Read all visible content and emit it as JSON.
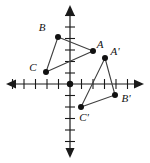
{
  "figure": {
    "width": 150,
    "height": 163,
    "background_color": "#ffffff",
    "axis_color": "#1a1a1a",
    "shape_color": "#3f3f3f",
    "point_color": "#111111"
  },
  "axes": {
    "origin": {
      "x": 70,
      "y": 84
    },
    "tick_spacing": 11.5,
    "x_axis": {
      "start_x": 6,
      "end_x": 144,
      "y": 84,
      "ticks": [
        -5,
        -4,
        -3,
        -2,
        -1,
        1,
        2,
        3,
        4,
        5
      ]
    },
    "y_axis": {
      "x": 70,
      "start_y": 5,
      "end_y": 158,
      "ticks": [
        -6,
        -5,
        -4,
        -3,
        -2,
        -1,
        1,
        2,
        3,
        4,
        5,
        6
      ]
    },
    "arrowheads": [
      "left",
      "right",
      "up",
      "down"
    ],
    "labels_shown": false
  },
  "shapes": [
    {
      "name": "triangle-abc",
      "closed": true,
      "vertices": [
        {
          "label": "B",
          "px": {
            "x": 58,
            "y": 37
          },
          "grid": {
            "x": -1,
            "y": 4
          },
          "label_px": {
            "x": 42,
            "y": 31
          }
        },
        {
          "label": "A",
          "px": {
            "x": 93,
            "y": 51
          },
          "grid": {
            "x": 2,
            "y": 3
          },
          "label_px": {
            "x": 96,
            "y": 48
          }
        },
        {
          "label": "C",
          "px": {
            "x": 46,
            "y": 72
          },
          "grid": {
            "x": -2,
            "y": 1
          },
          "label_px": {
            "x": 29,
            "y": 71
          }
        }
      ]
    },
    {
      "name": "triangle-a-prime-b-prime-c-prime",
      "closed": true,
      "vertices": [
        {
          "label": "A'",
          "px": {
            "x": 105,
            "y": 58
          },
          "grid": {
            "x": 3,
            "y": 2
          },
          "label_px": {
            "x": 109,
            "y": 55
          }
        },
        {
          "label": "B'",
          "px": {
            "x": 115,
            "y": 95
          },
          "grid": {
            "x": 4,
            "y": -1
          },
          "label_px": {
            "x": 119,
            "y": 102
          }
        },
        {
          "label": "C'",
          "px": {
            "x": 81,
            "y": 107
          },
          "grid": {
            "x": 1,
            "y": -2
          },
          "label_px": {
            "x": 79,
            "y": 121
          }
        }
      ]
    }
  ]
}
